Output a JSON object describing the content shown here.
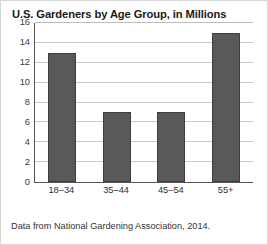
{
  "chart_data": {
    "type": "bar",
    "title": "U.S. Gardeners by Age Group, in Millions",
    "categories": [
      "18–34",
      "35–44",
      "45–54",
      "55+"
    ],
    "values": [
      13,
      7,
      7,
      15
    ],
    "xlabel": "",
    "ylabel": "",
    "ylim": [
      0,
      16
    ],
    "yticks": [
      0,
      2,
      4,
      6,
      8,
      10,
      12,
      14,
      16
    ],
    "ytick_labels": [
      "0",
      "2",
      "4",
      "6",
      "8",
      "10",
      "12",
      "14",
      "16"
    ],
    "grid": true,
    "legend": false,
    "bar_color": "#595959",
    "gridline_color": "#c9c9c9",
    "axis_color": "#555555",
    "source_note": "Data from National Gardening Association, 2014."
  }
}
